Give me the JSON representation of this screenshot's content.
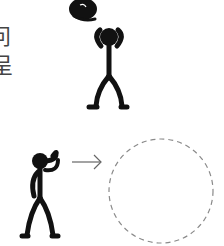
{
  "text": {
    "line1": "问",
    "line2": "呈"
  },
  "figures": {
    "top": {
      "label": "stick-figure-holding-head"
    },
    "bottom": {
      "label": "stick-figure-pointing"
    },
    "arrow": {
      "label": "arrow-right"
    },
    "circle": {
      "label": "dashed-empty-circle",
      "stroke": "#8a8a8a"
    }
  },
  "colors": {
    "ink": "#111111",
    "text": "#444444",
    "dash": "#8a8a8a"
  }
}
